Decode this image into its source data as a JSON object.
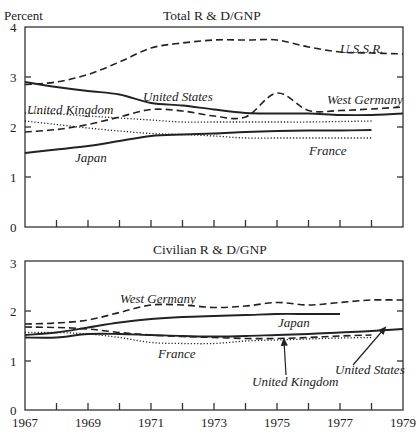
{
  "chart_data": [
    {
      "type": "line",
      "title": "Total R & D/GNP",
      "ylabel": "Percent",
      "xlabel": "",
      "ylim": [
        0,
        4
      ],
      "yticks": [
        "0",
        "1",
        "2",
        "3",
        "4"
      ],
      "xlim": [
        1967,
        1979
      ],
      "grid": false,
      "legend": "inline labels",
      "series": [
        {
          "name": "U.S.S.R.",
          "style": "dashed",
          "x": [
            1967,
            1968,
            1969,
            1970,
            1971,
            1972,
            1973,
            1974,
            1975,
            1976,
            1977,
            1978,
            1979
          ],
          "values": [
            2.85,
            2.9,
            3.05,
            3.3,
            3.58,
            3.68,
            3.74,
            3.74,
            3.74,
            3.6,
            3.5,
            3.48,
            3.46
          ]
        },
        {
          "name": "United States",
          "style": "solid",
          "x": [
            1967,
            1968,
            1969,
            1970,
            1971,
            1972,
            1973,
            1974,
            1975,
            1976,
            1977,
            1978,
            1979
          ],
          "values": [
            2.9,
            2.8,
            2.72,
            2.65,
            2.48,
            2.43,
            2.35,
            2.28,
            2.27,
            2.27,
            2.24,
            2.24,
            2.27
          ]
        },
        {
          "name": "West Germany",
          "style": "dashed",
          "x": [
            1967,
            1968,
            1969,
            1970,
            1971,
            1972,
            1973,
            1974,
            1975,
            1976,
            1977,
            1978,
            1979
          ],
          "values": [
            1.9,
            1.95,
            2.05,
            2.2,
            2.35,
            2.32,
            2.22,
            2.2,
            2.68,
            2.33,
            2.33,
            2.36,
            2.4
          ]
        },
        {
          "name": "United Kingdom",
          "style": "dotted",
          "x": [
            1967,
            1968,
            1969,
            1970,
            1971,
            1972,
            1973,
            1974,
            1975,
            1976,
            1977,
            1978
          ],
          "values": [
            2.28,
            2.26,
            2.22,
            2.18,
            2.14,
            2.1,
            2.1,
            2.1,
            2.1,
            2.1,
            2.11,
            2.12
          ]
        },
        {
          "name": "France",
          "style": "dotted",
          "x": [
            1967,
            1968,
            1969,
            1970,
            1971,
            1972,
            1973,
            1974,
            1975,
            1976,
            1977,
            1978
          ],
          "values": [
            2.12,
            2.05,
            1.98,
            1.92,
            1.87,
            1.85,
            1.82,
            1.78,
            1.78,
            1.78,
            1.78,
            1.78
          ]
        },
        {
          "name": "Japan",
          "style": "solid",
          "x": [
            1967,
            1968,
            1969,
            1970,
            1971,
            1972,
            1973,
            1974,
            1975,
            1976,
            1977,
            1978
          ],
          "values": [
            1.48,
            1.55,
            1.62,
            1.72,
            1.82,
            1.85,
            1.87,
            1.9,
            1.92,
            1.93,
            1.93,
            1.94
          ]
        }
      ],
      "labels": [
        {
          "text": "U.S.S.R.",
          "x": 340,
          "y": 53
        },
        {
          "text": "United States",
          "x": 143,
          "y": 101
        },
        {
          "text": "West Germany",
          "x": 327,
          "y": 104
        },
        {
          "text": "United Kingdom",
          "x": 27,
          "y": 114
        },
        {
          "text": "France",
          "x": 309,
          "y": 155
        },
        {
          "text": "Japan",
          "x": 75,
          "y": 162
        }
      ]
    },
    {
      "type": "line",
      "title": "Civilian R & D/GNP",
      "ylabel": "",
      "xlabel": "",
      "ylim": [
        0,
        3
      ],
      "yticks": [
        "0",
        "1",
        "2",
        "3"
      ],
      "xlim": [
        1967,
        1979
      ],
      "xticks": [
        "1967",
        "1969",
        "1971",
        "1973",
        "1975",
        "1977",
        "1979"
      ],
      "grid": false,
      "legend": "inline labels",
      "series": [
        {
          "name": "West Germany",
          "style": "dashed",
          "x": [
            1967,
            1968,
            1969,
            1970,
            1971,
            1972,
            1973,
            1974,
            1975,
            1976,
            1977,
            1978,
            1979
          ],
          "values": [
            1.72,
            1.74,
            1.8,
            1.95,
            2.1,
            2.1,
            2.05,
            2.08,
            2.15,
            2.1,
            2.15,
            2.2,
            2.2
          ]
        },
        {
          "name": "Japan",
          "style": "solid",
          "x": [
            1967,
            1968,
            1969,
            1970,
            1971,
            1972,
            1973,
            1974,
            1975,
            1976,
            1977
          ],
          "values": [
            1.5,
            1.55,
            1.65,
            1.75,
            1.82,
            1.86,
            1.88,
            1.9,
            1.92,
            1.92,
            1.92
          ]
        },
        {
          "name": "United Kingdom",
          "style": "dashed",
          "x": [
            1967,
            1968,
            1969,
            1970,
            1971,
            1972,
            1973,
            1974,
            1975,
            1976,
            1977,
            1978
          ],
          "values": [
            1.66,
            1.65,
            1.62,
            1.55,
            1.5,
            1.47,
            1.45,
            1.43,
            1.43,
            1.45,
            1.48,
            1.5
          ]
        },
        {
          "name": "United States",
          "style": "solid",
          "x": [
            1967,
            1968,
            1969,
            1970,
            1971,
            1972,
            1973,
            1974,
            1975,
            1976,
            1977,
            1978,
            1979
          ],
          "values": [
            1.45,
            1.45,
            1.52,
            1.52,
            1.5,
            1.48,
            1.47,
            1.48,
            1.5,
            1.52,
            1.55,
            1.58,
            1.62
          ]
        },
        {
          "name": "France",
          "style": "dotted",
          "x": [
            1967,
            1968,
            1969,
            1970,
            1971,
            1972,
            1973,
            1974,
            1975,
            1976,
            1977,
            1978
          ],
          "values": [
            1.55,
            1.55,
            1.52,
            1.45,
            1.35,
            1.33,
            1.33,
            1.38,
            1.4,
            1.42,
            1.44,
            1.45
          ]
        }
      ],
      "labels": [
        {
          "text": "West Germany",
          "x": 120,
          "y": 303
        },
        {
          "text": "Japan",
          "x": 278,
          "y": 327
        },
        {
          "text": "France",
          "x": 158,
          "y": 358
        },
        {
          "text": "United Kingdom",
          "x": 252,
          "y": 386
        },
        {
          "text": "United States",
          "x": 335,
          "y": 374
        }
      ],
      "annotations": [
        {
          "type": "arrow",
          "label": "United Kingdom",
          "from": [
            286,
            375
          ],
          "to": [
            284,
            341
          ]
        },
        {
          "type": "arrow",
          "label": "United States",
          "from": [
            353,
            365
          ],
          "to": [
            384,
            329
          ]
        }
      ]
    }
  ]
}
